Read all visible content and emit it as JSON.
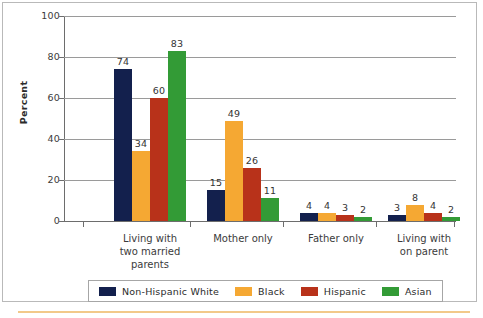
{
  "chart_data": {
    "type": "bar",
    "title": "",
    "xlabel": "",
    "ylabel": "Percent",
    "ylim": [
      0,
      100
    ],
    "yticks": [
      "0",
      "20",
      "40",
      "60",
      "80",
      "100"
    ],
    "grid": true,
    "legend_position": "bottom",
    "categories": [
      "Living with\ntwo married\nparents",
      "Mother only",
      "Father only",
      "Living with\non parent"
    ],
    "category_lines": [
      [
        "Living with",
        "two married",
        "parents"
      ],
      [
        "Mother only"
      ],
      [
        "Father only"
      ],
      [
        "Living with",
        "on parent"
      ]
    ],
    "series": [
      {
        "name": "Non-Hispanic White",
        "color": "#13204d",
        "values": [
          74,
          15,
          4,
          3
        ]
      },
      {
        "name": "Black",
        "color": "#f5a833",
        "values": [
          34,
          49,
          4,
          8
        ]
      },
      {
        "name": "Hispanic",
        "color": "#b8321a",
        "values": [
          60,
          26,
          3,
          4
        ]
      },
      {
        "name": "Asian",
        "color": "#339b36",
        "values": [
          83,
          11,
          2,
          2
        ]
      }
    ]
  },
  "axis": {
    "y_title": "Percent",
    "y_ticks": [
      "100",
      "80",
      "60",
      "40",
      "20",
      "0"
    ]
  },
  "legend": {
    "items": [
      {
        "label": "Non-Hispanic White",
        "color": "#13204d"
      },
      {
        "label": "Black",
        "color": "#f5a833"
      },
      {
        "label": "Hispanic",
        "color": "#b8321a"
      },
      {
        "label": "Asian",
        "color": "#339b36"
      }
    ]
  }
}
